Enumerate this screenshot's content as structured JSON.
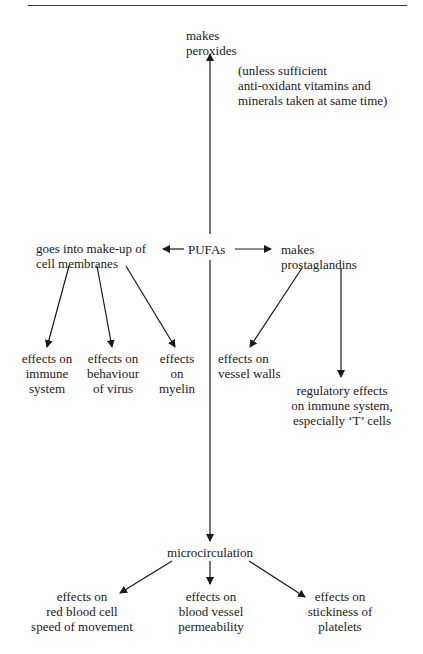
{
  "diagram": {
    "center": "PUFAs",
    "top": [
      "makes",
      "peroxides"
    ],
    "top_note": [
      "(unless sufficient",
      "anti-oxidant vitamins and",
      "minerals taken at same time)"
    ],
    "left": [
      "goes into make-up of",
      "cell membranes"
    ],
    "right": [
      "makes",
      "prostaglandins"
    ],
    "left_children": [
      [
        "effects on",
        "immune",
        "system"
      ],
      [
        "effects on",
        "behaviour",
        "of virus"
      ],
      [
        "effects",
        "on",
        "myelin"
      ]
    ],
    "right_children": [
      [
        "effects on",
        "vessel walls"
      ],
      [
        "regulatory effects",
        "on immune system,",
        "especially ‘T’ cells"
      ]
    ],
    "bottom": "microcirculation",
    "bottom_children": [
      [
        "effects on",
        "red blood cell",
        "speed of movement"
      ],
      [
        "effects on",
        "blood vessel",
        "permeability"
      ],
      [
        "effects on",
        "stickiness of",
        "platelets"
      ]
    ]
  }
}
